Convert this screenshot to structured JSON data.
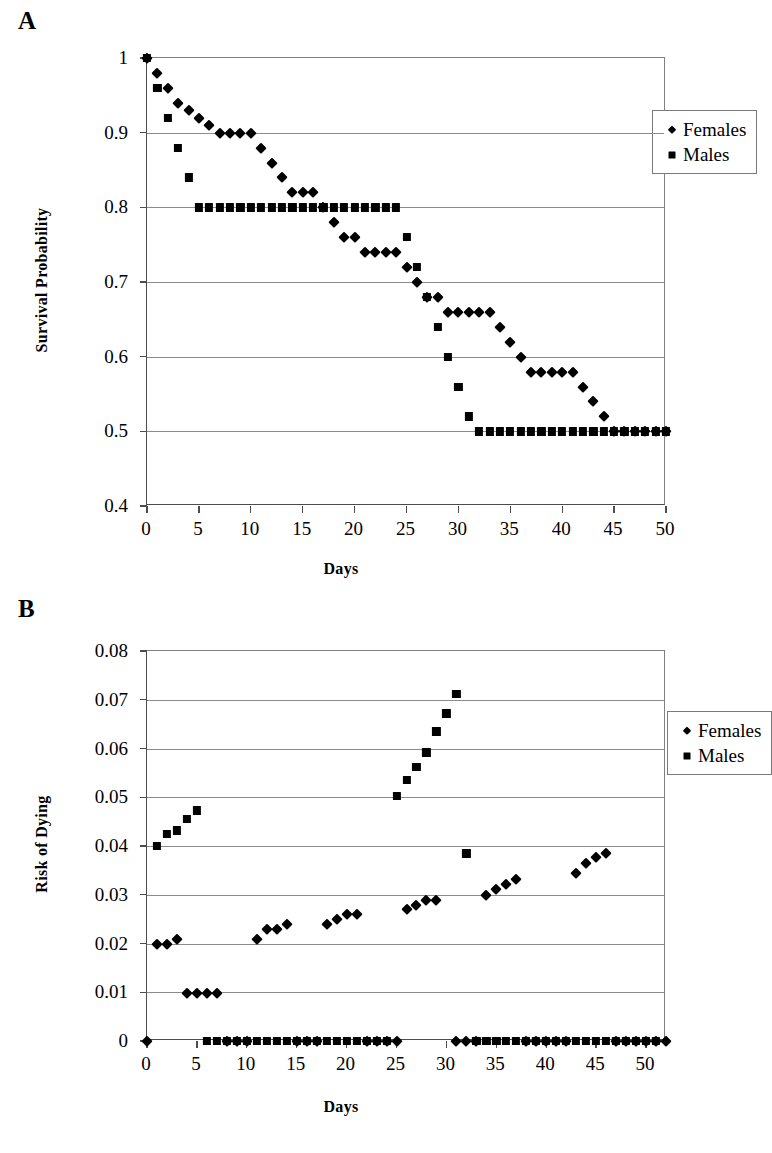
{
  "figure": {
    "panels": [
      {
        "id": "A",
        "label": "A",
        "legend": [
          {
            "name": "Females",
            "marker": "diamond-marker"
          },
          {
            "name": "Males",
            "marker": "square-marker"
          }
        ]
      },
      {
        "id": "B",
        "label": "B",
        "legend": [
          {
            "name": "Females",
            "marker": "diamond-marker"
          },
          {
            "name": "Males",
            "marker": "square-marker"
          }
        ]
      }
    ]
  },
  "chart_data": [
    {
      "panel": "A",
      "type": "scatter",
      "title": "",
      "xlabel": "Days",
      "ylabel": "Survival Probability",
      "xlim": [
        0,
        50
      ],
      "ylim": [
        0.4,
        1
      ],
      "xticks": [
        0,
        5,
        10,
        15,
        20,
        25,
        30,
        35,
        40,
        45,
        50
      ],
      "xticklabels": [
        "0",
        "5",
        "10",
        "15",
        "20",
        "25",
        "30",
        "35",
        "40",
        "45",
        "50"
      ],
      "yticks": [
        0.4,
        0.5,
        0.6,
        0.7,
        0.8,
        0.9,
        1
      ],
      "yticklabels": [
        "0.4",
        "0.5",
        "0.6",
        "0.7",
        "0.8",
        "0.9",
        "1"
      ],
      "grid": "horizontal",
      "legend_position": "top-right",
      "series": [
        {
          "name": "Females",
          "marker": "diamond",
          "x": [
            0,
            1,
            2,
            3,
            4,
            5,
            6,
            7,
            8,
            9,
            10,
            11,
            12,
            13,
            14,
            15,
            16,
            17,
            18,
            19,
            20,
            21,
            22,
            23,
            24,
            25,
            26,
            27,
            28,
            29,
            30,
            31,
            32,
            33,
            34,
            35,
            36,
            37,
            38,
            39,
            40,
            41,
            42,
            43,
            44,
            45,
            46,
            47,
            48,
            49,
            50
          ],
          "y": [
            1,
            0.98,
            0.96,
            0.94,
            0.93,
            0.92,
            0.91,
            0.9,
            0.9,
            0.9,
            0.9,
            0.88,
            0.86,
            0.84,
            0.82,
            0.82,
            0.82,
            0.8,
            0.78,
            0.76,
            0.76,
            0.74,
            0.74,
            0.74,
            0.74,
            0.72,
            0.7,
            0.68,
            0.68,
            0.66,
            0.66,
            0.66,
            0.66,
            0.66,
            0.64,
            0.62,
            0.6,
            0.58,
            0.58,
            0.58,
            0.58,
            0.58,
            0.56,
            0.54,
            0.52,
            0.5,
            0.5,
            0.5,
            0.5,
            0.5,
            0.5
          ]
        },
        {
          "name": "Males",
          "marker": "square",
          "x": [
            0,
            1,
            2,
            3,
            4,
            5,
            6,
            7,
            8,
            9,
            10,
            11,
            12,
            13,
            14,
            15,
            16,
            17,
            18,
            19,
            20,
            21,
            22,
            23,
            24,
            25,
            26,
            27,
            28,
            29,
            30,
            31,
            32,
            33,
            34,
            35,
            36,
            37,
            38,
            39,
            40,
            41,
            42,
            43,
            44,
            45,
            46,
            47,
            48,
            49,
            50
          ],
          "y": [
            1,
            0.96,
            0.92,
            0.88,
            0.84,
            0.8,
            0.8,
            0.8,
            0.8,
            0.8,
            0.8,
            0.8,
            0.8,
            0.8,
            0.8,
            0.8,
            0.8,
            0.8,
            0.8,
            0.8,
            0.8,
            0.8,
            0.8,
            0.8,
            0.8,
            0.76,
            0.72,
            0.68,
            0.64,
            0.6,
            0.56,
            0.52,
            0.5,
            0.5,
            0.5,
            0.5,
            0.5,
            0.5,
            0.5,
            0.5,
            0.5,
            0.5,
            0.5,
            0.5,
            0.5,
            0.5,
            0.5,
            0.5,
            0.5,
            0.5,
            0.5
          ]
        }
      ]
    },
    {
      "panel": "B",
      "type": "scatter",
      "title": "",
      "xlabel": "Days",
      "ylabel": "Risk of Dying",
      "xlim": [
        0,
        52
      ],
      "ylim": [
        0,
        0.08
      ],
      "xticks": [
        0,
        5,
        10,
        15,
        20,
        25,
        30,
        35,
        40,
        45,
        50
      ],
      "xticklabels": [
        "0",
        "5",
        "10",
        "15",
        "20",
        "25",
        "30",
        "35",
        "40",
        "45",
        "50"
      ],
      "yticks": [
        0,
        0.01,
        0.02,
        0.03,
        0.04,
        0.05,
        0.06,
        0.07,
        0.08
      ],
      "yticklabels": [
        "0",
        "0.01",
        "0.02",
        "0.03",
        "0.04",
        "0.05",
        "0.06",
        "0.07",
        "0.08"
      ],
      "grid": "horizontal",
      "legend_position": "top-right",
      "series": [
        {
          "name": "Females",
          "marker": "diamond",
          "x": [
            0,
            1,
            2,
            3,
            4,
            5,
            6,
            7,
            8,
            9,
            10,
            11,
            12,
            13,
            14,
            15,
            16,
            17,
            18,
            19,
            20,
            21,
            22,
            23,
            24,
            25,
            26,
            27,
            28,
            29,
            31,
            32,
            33,
            34,
            35,
            36,
            37,
            38,
            39,
            40,
            41,
            42,
            43,
            44,
            45,
            46,
            47,
            48,
            49,
            50,
            51,
            52
          ],
          "y": [
            0,
            0.02,
            0.02,
            0.021,
            0.0098,
            0.0098,
            0.0098,
            0.0098,
            0,
            0,
            0,
            0.021,
            0.023,
            0.023,
            0.024,
            0,
            0,
            0,
            0.024,
            0.025,
            0.026,
            0.026,
            0,
            0,
            0,
            0,
            0.027,
            0.028,
            0.029,
            0.029,
            0,
            0,
            0,
            0.03,
            0.0312,
            0.0322,
            0.0333,
            0,
            0,
            0,
            0,
            0,
            0.0345,
            0.0365,
            0.0377,
            0.0385,
            0,
            0,
            0,
            0,
            0,
            0
          ]
        },
        {
          "name": "Males",
          "marker": "square",
          "x": [
            1,
            2,
            3,
            4,
            5,
            6,
            7,
            8,
            9,
            10,
            11,
            12,
            13,
            14,
            15,
            16,
            17,
            18,
            19,
            20,
            21,
            22,
            23,
            24,
            25,
            26,
            27,
            28,
            29,
            30,
            31,
            32,
            33,
            34,
            35,
            36,
            37,
            38,
            39,
            40,
            41,
            42,
            43,
            44,
            45,
            46,
            47,
            48,
            49,
            50,
            51
          ],
          "y": [
            0.04,
            0.0425,
            0.0432,
            0.0455,
            0.0473,
            0,
            0,
            0,
            0,
            0,
            0,
            0,
            0,
            0,
            0,
            0,
            0,
            0,
            0,
            0,
            0,
            0,
            0,
            0,
            0.0503,
            0.0535,
            0.0562,
            0.0592,
            0.0635,
            0.0672,
            0.0712,
            0.0385,
            0,
            0,
            0,
            0,
            0,
            0,
            0,
            0,
            0,
            0,
            0,
            0,
            0,
            0,
            0,
            0,
            0,
            0,
            0
          ]
        }
      ]
    }
  ]
}
